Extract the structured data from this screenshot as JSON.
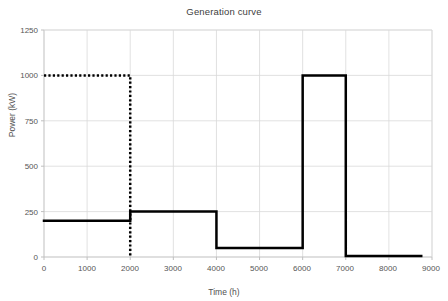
{
  "chart_data": {
    "type": "line",
    "title": "Generation curve",
    "xlabel": "Time (h)",
    "ylabel": "Power (kW)",
    "xlim": [
      0,
      9000
    ],
    "ylim": [
      0,
      1250
    ],
    "xticks": [
      0,
      1000,
      2000,
      3000,
      4000,
      5000,
      6000,
      7000,
      8000,
      9000
    ],
    "yticks": [
      0,
      250,
      500,
      750,
      1000,
      1250
    ],
    "grid": true,
    "legend": "none",
    "series": [
      {
        "name": "generation-step-curve",
        "style": "solid",
        "color": "#000000",
        "width": 2.5,
        "points": [
          [
            0,
            200
          ],
          [
            2000,
            200
          ],
          [
            2000,
            250
          ],
          [
            4000,
            250
          ],
          [
            4000,
            50
          ],
          [
            6000,
            50
          ],
          [
            6000,
            1000
          ],
          [
            7000,
            1000
          ],
          [
            7000,
            5
          ],
          [
            8750,
            5
          ]
        ]
      },
      {
        "name": "demand-dotted-curve",
        "style": "dotted",
        "color": "#000000",
        "width": 2.5,
        "points": [
          [
            0,
            1000
          ],
          [
            2000,
            1000
          ],
          [
            2000,
            0
          ]
        ]
      }
    ]
  },
  "axis": {
    "ytick_labels": [
      "1250",
      "1000",
      "750",
      "500",
      "250",
      "0"
    ],
    "xtick_labels": [
      "0",
      "1000",
      "2000",
      "3000",
      "4000",
      "5000",
      "6000",
      "7000",
      "8000",
      "9000"
    ]
  },
  "colors": {
    "grid": "#d9d9d9",
    "axis": "#bfbfbf",
    "line": "#000000",
    "text": "#595959"
  }
}
